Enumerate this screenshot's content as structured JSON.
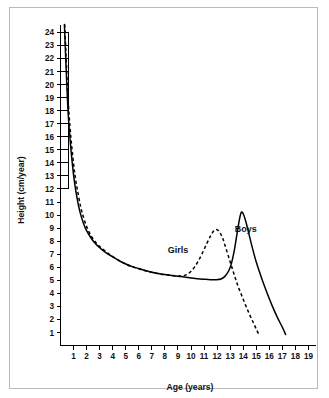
{
  "chart_data": {
    "type": "line",
    "title": "",
    "xlabel": "Age (years)",
    "ylabel": "Height (cm/year)",
    "xlim": [
      0,
      19.6
    ],
    "ylim": [
      0,
      24.6
    ],
    "xticks": [
      "1",
      "2",
      "3",
      "4",
      "5",
      "6",
      "7",
      "8",
      "9",
      "10",
      "11",
      "12",
      "13",
      "14",
      "15",
      "16",
      "17",
      "18",
      "19"
    ],
    "yticks": [
      "1",
      "2",
      "3",
      "4",
      "5",
      "6",
      "7",
      "8",
      "9",
      "10",
      "11",
      "12",
      "13",
      "14",
      "15",
      "16",
      "17",
      "18",
      "19",
      "20",
      "21",
      "22",
      "23",
      "24"
    ],
    "grid": false,
    "legend_position": "inline-annotations",
    "annotations": [
      {
        "text": "Girls",
        "x": 9.0,
        "y": 7.1
      },
      {
        "text": "Boys",
        "x": 14.2,
        "y": 8.7
      }
    ],
    "series": [
      {
        "name": "Boys",
        "style": "solid",
        "points": [
          [
            0.3,
            24.6
          ],
          [
            0.4,
            22.0
          ],
          [
            0.5,
            19.6
          ],
          [
            0.6,
            17.6
          ],
          [
            0.75,
            15.6
          ],
          [
            0.9,
            14.0
          ],
          [
            1.05,
            12.7
          ],
          [
            1.25,
            11.4
          ],
          [
            1.5,
            10.2
          ],
          [
            1.75,
            9.4
          ],
          [
            2.0,
            8.8
          ],
          [
            2.3,
            8.3
          ],
          [
            2.6,
            7.9
          ],
          [
            3.0,
            7.5
          ],
          [
            3.5,
            7.1
          ],
          [
            4.0,
            6.8
          ],
          [
            4.5,
            6.5
          ],
          [
            5.0,
            6.25
          ],
          [
            5.5,
            6.05
          ],
          [
            6.0,
            5.9
          ],
          [
            6.5,
            5.75
          ],
          [
            7.0,
            5.62
          ],
          [
            7.5,
            5.52
          ],
          [
            8.0,
            5.44
          ],
          [
            8.5,
            5.37
          ],
          [
            9.0,
            5.31
          ],
          [
            9.5,
            5.25
          ],
          [
            10.0,
            5.18
          ],
          [
            10.5,
            5.12
          ],
          [
            11.0,
            5.08
          ],
          [
            11.5,
            5.05
          ],
          [
            12.0,
            5.05
          ],
          [
            12.3,
            5.1
          ],
          [
            12.6,
            5.3
          ],
          [
            12.9,
            5.75
          ],
          [
            13.1,
            6.3
          ],
          [
            13.3,
            7.2
          ],
          [
            13.5,
            8.4
          ],
          [
            13.7,
            9.6
          ],
          [
            13.85,
            10.2
          ],
          [
            14.0,
            10.1
          ],
          [
            14.2,
            9.5
          ],
          [
            14.45,
            8.5
          ],
          [
            14.7,
            7.5
          ],
          [
            15.0,
            6.4
          ],
          [
            15.4,
            5.2
          ],
          [
            15.8,
            4.1
          ],
          [
            16.2,
            3.1
          ],
          [
            16.6,
            2.2
          ],
          [
            17.0,
            1.4
          ],
          [
            17.25,
            0.85
          ]
        ]
      },
      {
        "name": "Girls",
        "style": "dashed",
        "points": [
          [
            0.32,
            24.6
          ],
          [
            0.42,
            22.3
          ],
          [
            0.52,
            20.0
          ],
          [
            0.65,
            17.8
          ],
          [
            0.8,
            15.9
          ],
          [
            0.95,
            14.4
          ],
          [
            1.1,
            13.1
          ],
          [
            1.3,
            11.9
          ],
          [
            1.55,
            10.6
          ],
          [
            1.8,
            9.7
          ],
          [
            2.05,
            9.0
          ],
          [
            2.35,
            8.4
          ],
          [
            2.7,
            7.9
          ],
          [
            3.1,
            7.5
          ],
          [
            3.6,
            7.1
          ],
          [
            4.1,
            6.75
          ],
          [
            4.6,
            6.45
          ],
          [
            5.1,
            6.2
          ],
          [
            5.6,
            6.0
          ],
          [
            6.1,
            5.85
          ],
          [
            6.6,
            5.7
          ],
          [
            7.1,
            5.58
          ],
          [
            7.6,
            5.48
          ],
          [
            8.1,
            5.42
          ],
          [
            8.6,
            5.36
          ],
          [
            9.0,
            5.32
          ],
          [
            9.4,
            5.35
          ],
          [
            9.7,
            5.45
          ],
          [
            10.0,
            5.7
          ],
          [
            10.3,
            6.05
          ],
          [
            10.6,
            6.55
          ],
          [
            10.9,
            7.15
          ],
          [
            11.2,
            7.8
          ],
          [
            11.5,
            8.4
          ],
          [
            11.75,
            8.8
          ],
          [
            11.95,
            8.9
          ],
          [
            12.15,
            8.75
          ],
          [
            12.4,
            8.3
          ],
          [
            12.6,
            7.7
          ],
          [
            12.85,
            6.9
          ],
          [
            13.1,
            6.1
          ],
          [
            13.35,
            5.3
          ],
          [
            13.6,
            4.55
          ],
          [
            13.9,
            3.8
          ],
          [
            14.2,
            3.05
          ],
          [
            14.5,
            2.35
          ],
          [
            14.8,
            1.7
          ],
          [
            15.05,
            1.15
          ],
          [
            15.2,
            0.85
          ]
        ]
      }
    ]
  }
}
